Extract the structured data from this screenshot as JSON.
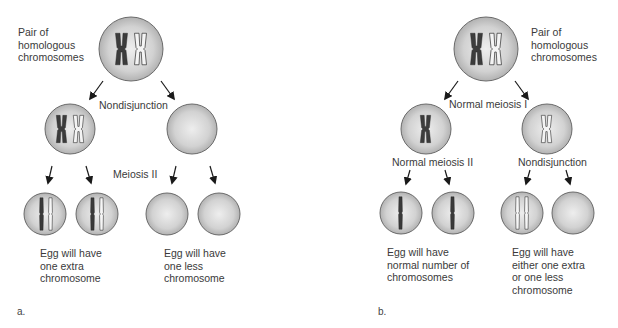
{
  "figure": {
    "type": "meiosis nondisjunction diagram",
    "colors": {
      "cell_fill_center": "#ececec",
      "cell_fill_edge": "#b4b4b4",
      "cell_stroke": "#6a6a6a",
      "dark_chromosome": "#3c3c3c",
      "light_chromosome_outline": "#4a4a4a",
      "arrow": "#1a1a1a",
      "text": "#3a3a3a"
    }
  },
  "panel_a": {
    "letter": "a.",
    "parent_label": "Pair of\nhomologous\nchromosomes",
    "step1_label": "Nondisjunction",
    "step2_label": "Meiosis II",
    "outcome_left": "Egg will have\none extra\nchromosome",
    "outcome_right": "Egg will have\none less\nchromosome",
    "cells": [
      {
        "id": "parent",
        "contents": "dark X + light X (homologous pair)"
      },
      {
        "id": "meiosisI-left",
        "contents": "dark X + light X"
      },
      {
        "id": "meiosisI-right",
        "contents": "empty"
      },
      {
        "id": "egg-1",
        "contents": "dark chromatid + light chromatid"
      },
      {
        "id": "egg-2",
        "contents": "dark chromatid + light chromatid"
      },
      {
        "id": "egg-3",
        "contents": "empty"
      },
      {
        "id": "egg-4",
        "contents": "empty"
      }
    ]
  },
  "panel_b": {
    "letter": "b.",
    "parent_label": "Pair of\nhomologous\nchromosomes",
    "step1_label": "Normal meiosis I",
    "step2_left_label": "Normal meiosis II",
    "step2_right_label": "Nondisjunction",
    "outcome_left": "Egg will have\nnormal number of\nchromosomes",
    "outcome_right": "Egg will have\neither one extra\nor one less\nchromosome",
    "cells": [
      {
        "id": "parent",
        "contents": "dark X + light X (homologous pair)"
      },
      {
        "id": "meiosisI-left",
        "contents": "dark X"
      },
      {
        "id": "meiosisI-right",
        "contents": "light X"
      },
      {
        "id": "egg-1",
        "contents": "dark chromatid"
      },
      {
        "id": "egg-2",
        "contents": "dark chromatid"
      },
      {
        "id": "egg-3",
        "contents": "two light chromatids"
      },
      {
        "id": "egg-4",
        "contents": "empty"
      }
    ]
  }
}
